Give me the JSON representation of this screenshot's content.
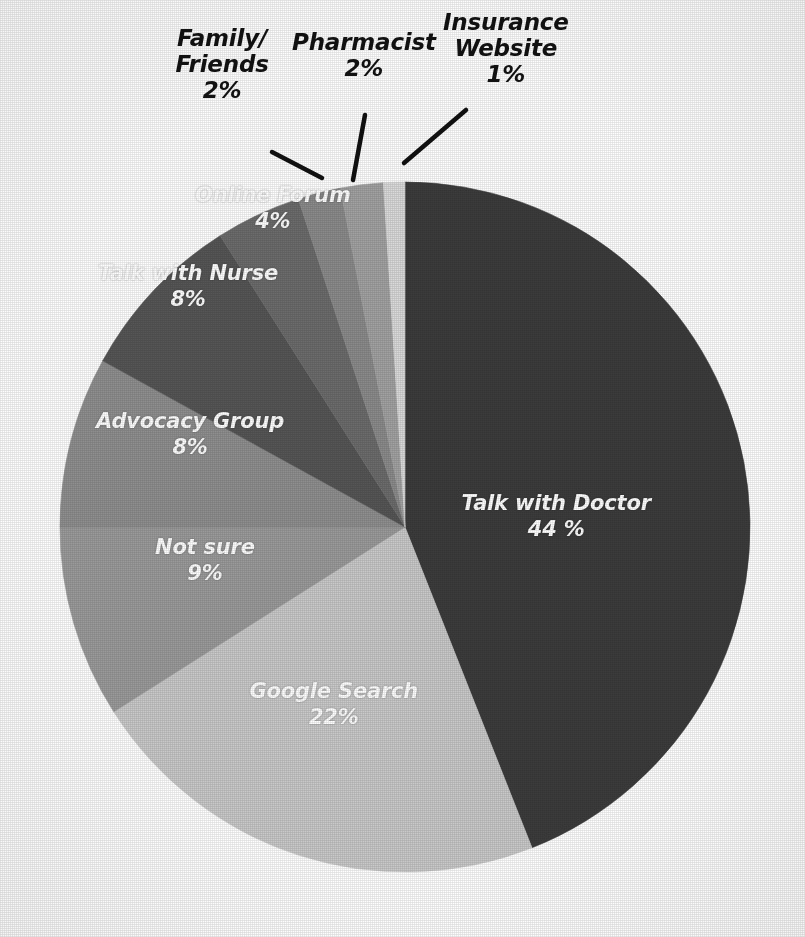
{
  "figure": {
    "background_color": "#ffffff",
    "center_x": 405,
    "center_y": 527,
    "radius": 345,
    "start_angle_deg": 0,
    "direction": "clockwise",
    "label_text_color": "#ffffff",
    "external_label_color": "#121212",
    "leader_line_color": "#111111"
  },
  "chart_data": {
    "type": "pie",
    "title": "",
    "subtitle": "",
    "xlabel": "",
    "ylabel": "",
    "legend_position": "none",
    "grid": false,
    "value_unit": "%",
    "categories": [
      "Talk with Doctor",
      "Google Search",
      "Not sure",
      "Advocacy Group",
      "Talk with Nurse",
      "Online Forum",
      "Family/Friends",
      "Pharmacist",
      "Insurance Website"
    ],
    "values": [
      44,
      22,
      9,
      8,
      8,
      4,
      2,
      2,
      1
    ],
    "colors": [
      "#3c3c3c",
      "#c9c9c9",
      "#9b9b9b",
      "#8f8f8f",
      "#565656",
      "#6c6c6c",
      "#8b8b8b",
      "#a2a2a2",
      "#dadada"
    ],
    "slices": [
      {
        "name": "Talk with Doctor",
        "value": 44,
        "label": "Talk with Doctor",
        "value_label": "44 %",
        "color": "#3c3c3c",
        "label_placement": "inside",
        "label_x": 556,
        "label_y": 516
      },
      {
        "name": "Google Search",
        "value": 22,
        "label": "Google Search",
        "value_label": "22%",
        "color": "#c9c9c9",
        "label_placement": "inside",
        "label_x": 334,
        "label_y": 704
      },
      {
        "name": "Not sure",
        "value": 9,
        "label": "Not sure",
        "value_label": "9%",
        "color": "#9b9b9b",
        "label_placement": "inside",
        "label_x": 205,
        "label_y": 560
      },
      {
        "name": "Advocacy Group",
        "value": 8,
        "label": "Advocacy Group",
        "value_label": "8%",
        "color": "#8f8f8f",
        "label_placement": "inside",
        "label_x": 190,
        "label_y": 434
      },
      {
        "name": "Talk with Nurse",
        "value": 8,
        "label": "Talk with Nurse",
        "value_label": "8%",
        "color": "#565656",
        "label_placement": "inside",
        "label_x": 188,
        "label_y": 286
      },
      {
        "name": "Online Forum",
        "value": 4,
        "label": "Online Forum",
        "value_label": "4%",
        "color": "#6c6c6c",
        "label_placement": "inside",
        "label_x": 273,
        "label_y": 208
      },
      {
        "name": "Family/Friends",
        "value": 2,
        "label": "Family/\nFriends",
        "value_label": "2%",
        "color": "#8b8b8b",
        "label_placement": "outside",
        "label_x": 222,
        "label_y": 64
      },
      {
        "name": "Pharmacist",
        "value": 2,
        "label": "Pharmacist",
        "value_label": "2%",
        "color": "#a2a2a2",
        "label_placement": "outside",
        "label_x": 364,
        "label_y": 55
      },
      {
        "name": "Insurance Website",
        "value": 1,
        "label": "Insurance\nWebsite",
        "value_label": "1%",
        "color": "#dadada",
        "label_placement": "outside",
        "label_x": 506,
        "label_y": 48
      }
    ],
    "leader_lines": [
      {
        "name": "family-friends",
        "x1": 272,
        "y1": 152,
        "x2": 322,
        "y2": 178
      },
      {
        "name": "pharmacist",
        "x1": 365,
        "y1": 115,
        "x2": 353,
        "y2": 180
      },
      {
        "name": "insurance-website",
        "x1": 466,
        "y1": 110,
        "x2": 404,
        "y2": 163
      }
    ]
  }
}
